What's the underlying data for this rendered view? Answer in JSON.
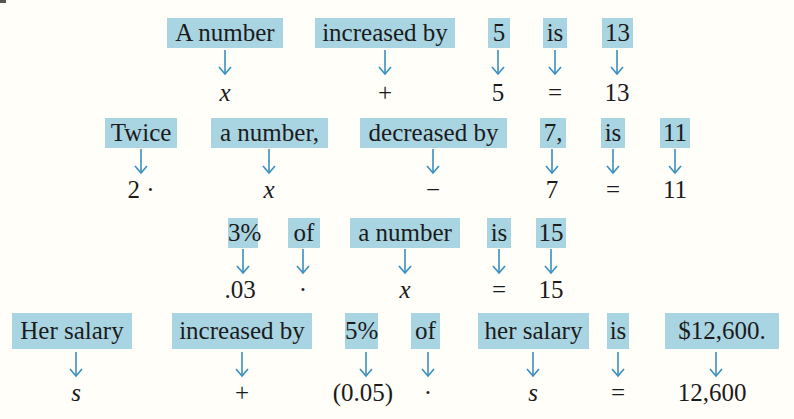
{
  "colors": {
    "highlight": "#a9d4e2",
    "arrow": "#3a8fc0",
    "text": "#1b1b1b",
    "background": "#fffef9"
  },
  "rows": [
    {
      "phrases": [
        {
          "text": "A number",
          "formula": "x"
        },
        {
          "text": "increased by",
          "formula": "+"
        },
        {
          "text": "5",
          "formula": "5"
        },
        {
          "text": "is",
          "formula": "="
        },
        {
          "text": "13",
          "formula": "13"
        }
      ]
    },
    {
      "phrases": [
        {
          "text": "Twice",
          "formula": "2 ·"
        },
        {
          "text": "a number,",
          "formula": "x"
        },
        {
          "text": "decreased by",
          "formula": "−"
        },
        {
          "text": "7,",
          "formula": "7"
        },
        {
          "text": "is",
          "formula": "="
        },
        {
          "text": "11",
          "formula": "11"
        }
      ]
    },
    {
      "phrases": [
        {
          "text": "3%",
          "formula": ".03"
        },
        {
          "text": "of",
          "formula": "·"
        },
        {
          "text": "a number",
          "formula": "x"
        },
        {
          "text": "is",
          "formula": "="
        },
        {
          "text": "15",
          "formula": "15"
        }
      ]
    },
    {
      "phrases": [
        {
          "text": "Her salary",
          "formula": "s"
        },
        {
          "text": "increased by",
          "formula": "+"
        },
        {
          "text": "5%",
          "formula": "(0.05)"
        },
        {
          "text": "of",
          "formula": "·"
        },
        {
          "text": "her salary",
          "formula": "s"
        },
        {
          "text": "is",
          "formula": "="
        },
        {
          "text": "$12,600.",
          "formula": "12,600"
        }
      ]
    }
  ]
}
